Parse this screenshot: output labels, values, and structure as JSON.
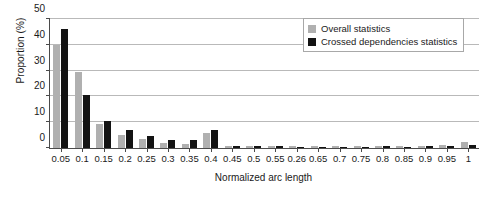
{
  "chart_data": {
    "type": "bar",
    "title": "",
    "xlabel": "Normalized arc length",
    "ylabel": "Proportion (%)",
    "ylim": [
      0,
      50
    ],
    "yticks": [
      0,
      10,
      20,
      30,
      40,
      50
    ],
    "grid": true,
    "legend_position": "top-right",
    "categories": [
      "0.05",
      "0.1",
      "0.15",
      "0.2",
      "0.25",
      "0.3",
      "0.35",
      "0.4",
      "0.45",
      "0.5",
      "0.55",
      "0.26",
      "0.65",
      "0.7",
      "0.75",
      "0.8",
      "0.85",
      "0.9",
      "0.95",
      "1"
    ],
    "series": [
      {
        "name": "Overall statistics",
        "color": "#b0b0b0",
        "values": [
          40.0,
          29.5,
          9.5,
          5.0,
          3.5,
          2.0,
          1.5,
          6.0,
          0.9,
          0.7,
          0.7,
          0.6,
          0.6,
          0.6,
          0.7,
          0.8,
          0.7,
          0.8,
          1.0,
          2.5
        ]
      },
      {
        "name": "Crossed dependencies statistics",
        "color": "#131313",
        "values": [
          46.0,
          20.5,
          10.5,
          7.0,
          4.5,
          3.0,
          3.0,
          7.0,
          0.8,
          0.6,
          0.6,
          0.5,
          0.5,
          0.5,
          0.5,
          0.6,
          0.5,
          0.6,
          0.7,
          1.0
        ]
      }
    ]
  },
  "legend": {
    "items": [
      {
        "label": "Overall statistics",
        "color": "#b0b0b0"
      },
      {
        "label": "Crossed dependencies statistics",
        "color": "#131313"
      }
    ]
  }
}
